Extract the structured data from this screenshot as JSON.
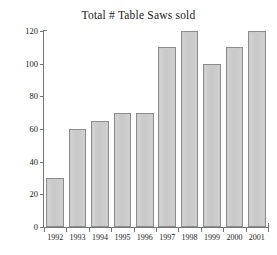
{
  "chart_data": {
    "type": "bar",
    "title": "Total # Table Saws sold",
    "xlabel": "",
    "ylabel": "",
    "categories": [
      "1992",
      "1993",
      "1994",
      "1995",
      "1996",
      "1997",
      "1998",
      "1999",
      "2000",
      "2001"
    ],
    "values": [
      30,
      60,
      65,
      70,
      70,
      110,
      120,
      100,
      110,
      120
    ],
    "ylim": [
      0,
      120
    ],
    "ytick_labels": [
      "0",
      "20",
      "40",
      "60",
      "80",
      "100",
      "120"
    ],
    "ytick_values": [
      0,
      20,
      40,
      60,
      80,
      100,
      120
    ],
    "grid": false,
    "legend": null,
    "legend_position": "none",
    "series": [
      {
        "name": "Table Saws sold",
        "values": [
          30,
          60,
          65,
          70,
          70,
          110,
          120,
          100,
          110,
          120
        ]
      }
    ],
    "colors": {
      "bar_fill": "#cbcbcb",
      "bar_border": "#8d8d8d",
      "axis": "#777777",
      "text": "#1b1b1b",
      "background": "#ffffff"
    }
  }
}
